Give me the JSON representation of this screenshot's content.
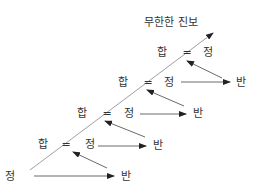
{
  "title": "무한한 진보",
  "colors": {
    "line": "#a0a0a0",
    "arrow": "#6a6a6a",
    "text": "#333333"
  },
  "levels": [
    {
      "synthesis": "합",
      "equals": "=",
      "thesis": "정",
      "antithesis": "반"
    },
    {
      "synthesis": "합",
      "equals": "=",
      "thesis": "정",
      "antithesis": "반"
    },
    {
      "synthesis": "합",
      "equals": "=",
      "thesis": "정",
      "antithesis": "반"
    },
    {
      "synthesis": "합",
      "equals": "=",
      "thesis": "정",
      "antithesis": "반"
    }
  ],
  "base": {
    "thesis": "정",
    "antithesis": "반"
  }
}
